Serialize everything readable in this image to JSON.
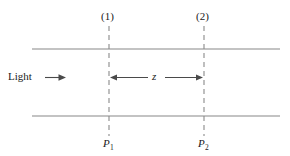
{
  "figure": {
    "width": 290,
    "height": 156,
    "background_color": "#ffffff"
  },
  "labels": {
    "plane_1": "(1)",
    "plane_2": "(2)",
    "light": "Light",
    "distance": "z",
    "point_1": "P",
    "point_1_subscript": "1",
    "point_2": "P",
    "point_2_subscript": "2"
  },
  "colors": {
    "boundary_line": "#888888",
    "dashed_line": "#8a8a8a",
    "arrow": "#4a4a4a",
    "text": "#1a1a1a"
  },
  "geometry": {
    "boundary_top_y": 49,
    "boundary_bottom_y": 116,
    "boundary_x_start": 32,
    "boundary_x_end": 280,
    "plane_1_x": 109,
    "plane_2_x": 204,
    "dashed_y_start": 26,
    "dashed_y_end": 136,
    "axis_y": 78,
    "light_arrow_x_start": 45,
    "light_arrow_x_end": 66
  }
}
